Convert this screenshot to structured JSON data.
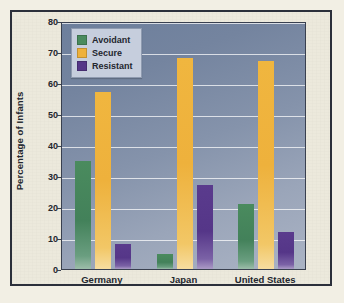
{
  "chart_data": {
    "type": "bar",
    "title": "",
    "xlabel": "",
    "ylabel": "Percentage of Infants",
    "ylim": [
      0,
      80
    ],
    "ytick_step": 10,
    "yticks": [
      "80",
      "70",
      "60",
      "50",
      "40",
      "30",
      "20",
      "10",
      "0"
    ],
    "grid": true,
    "legend_position": "top-left-inside",
    "categories": [
      "Germany",
      "Japan",
      "United States"
    ],
    "series": [
      {
        "name": "Avoidant",
        "color": "#4a8b5e",
        "values": [
          35,
          5,
          21
        ]
      },
      {
        "name": "Secure",
        "color": "#eeb13c",
        "values": [
          57,
          68,
          67
        ]
      },
      {
        "name": "Resistant",
        "color": "#553688",
        "values": [
          8,
          27,
          12
        ]
      }
    ]
  },
  "legend": {
    "items": [
      {
        "label": "Avoidant",
        "swatch": "legend-swatch-avoidant"
      },
      {
        "label": "Secure",
        "swatch": "legend-swatch-secure"
      },
      {
        "label": "Resistant",
        "swatch": "legend-swatch-resistant"
      }
    ]
  },
  "colors": {
    "frame_border": "#2b2f3a",
    "figure_background": "#ece9dc",
    "plot_background_top": "#6d7f9c",
    "plot_background_bottom": "#aab3c4",
    "gridline": "#ffffff",
    "avoidant": "#4a8b5e",
    "secure": "#eeb13c",
    "resistant": "#553688",
    "text": "#23262e"
  }
}
